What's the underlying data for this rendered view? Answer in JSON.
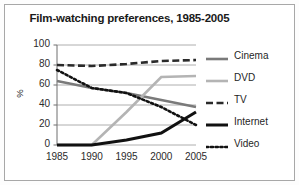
{
  "chart_data": {
    "type": "line",
    "title": "Film-watching preferences, 1985-2005",
    "xlabel": "",
    "ylabel": "%",
    "x": [
      1985,
      1990,
      1995,
      2000,
      2005
    ],
    "xticklabels": [
      "1985",
      "1990",
      "1995",
      "2000",
      "2005"
    ],
    "yticklabels": [
      "0",
      "20",
      "40",
      "60",
      "80",
      "100"
    ],
    "ylim": [
      0,
      100
    ],
    "ytick_step": 20,
    "grid": "horizontal",
    "legend_position": "right",
    "series": [
      {
        "name": "Cinema",
        "values": [
          64,
          57,
          52,
          45,
          38
        ],
        "color": "#7a7a7a",
        "style": "solid",
        "width": 2.6
      },
      {
        "name": "DVD",
        "values": [
          0,
          0,
          33,
          68,
          69
        ],
        "color": "#b4b4b4",
        "style": "solid",
        "width": 2.6
      },
      {
        "name": "TV",
        "values": [
          80,
          79,
          81,
          84,
          85
        ],
        "color": "#2a2a2a",
        "style": "dashed",
        "width": 2.6
      },
      {
        "name": "Internet",
        "values": [
          0,
          0,
          5,
          12,
          33
        ],
        "color": "#111111",
        "style": "solid",
        "width": 3.0
      },
      {
        "name": "Video",
        "values": [
          75,
          57,
          52,
          38,
          20
        ],
        "color": "#111111",
        "style": "dotted",
        "width": 2.6
      }
    ]
  }
}
